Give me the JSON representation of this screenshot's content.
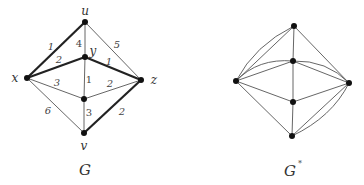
{
  "graph_g": {
    "caption": "G",
    "vertices": {
      "u": {
        "label": "u",
        "x": 85,
        "y": 22
      },
      "y": {
        "label": "y",
        "x": 85,
        "y": 57
      },
      "x": {
        "label": "x",
        "x": 27,
        "y": 78
      },
      "z": {
        "label": "z",
        "x": 141,
        "y": 80
      },
      "m": {
        "label": "",
        "x": 84,
        "y": 99
      },
      "v": {
        "label": "v",
        "x": 84,
        "y": 133
      }
    },
    "edges": [
      {
        "from": "x",
        "to": "u",
        "weight": "1",
        "bold": true
      },
      {
        "from": "u",
        "to": "y",
        "weight": "4",
        "bold": false
      },
      {
        "from": "u",
        "to": "z",
        "weight": "5",
        "bold": false
      },
      {
        "from": "x",
        "to": "y",
        "weight": "2",
        "bold": true
      },
      {
        "from": "y",
        "to": "z",
        "weight": "1",
        "bold": true
      },
      {
        "from": "x",
        "to": "m",
        "weight": "3",
        "bold": false
      },
      {
        "from": "y",
        "to": "m",
        "weight": "1",
        "bold": false
      },
      {
        "from": "m",
        "to": "z",
        "weight": "2",
        "bold": false
      },
      {
        "from": "x",
        "to": "v",
        "weight": "6",
        "bold": false
      },
      {
        "from": "m",
        "to": "v",
        "weight": "3",
        "bold": false
      },
      {
        "from": "v",
        "to": "z",
        "weight": "2",
        "bold": true
      }
    ]
  },
  "graph_gstar": {
    "caption": "G",
    "caption_superscript": "*",
    "vertices": {
      "top": {
        "x": 294,
        "y": 26
      },
      "midtop": {
        "x": 293,
        "y": 61
      },
      "left": {
        "x": 236,
        "y": 81
      },
      "right": {
        "x": 349,
        "y": 83
      },
      "midlow": {
        "x": 293,
        "y": 102
      },
      "bottom": {
        "x": 292,
        "y": 136
      }
    },
    "edge_count": 14
  }
}
